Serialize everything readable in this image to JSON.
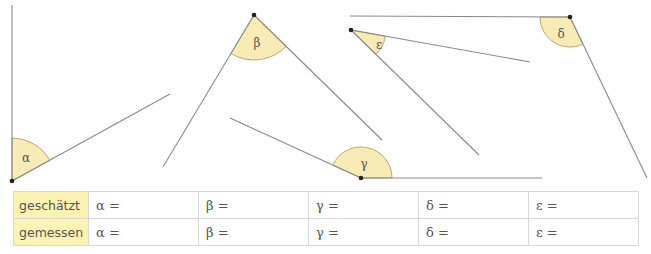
{
  "figure": {
    "angles": [
      {
        "name": "alpha",
        "symbol": "α"
      },
      {
        "name": "beta",
        "symbol": "β"
      },
      {
        "name": "gamma",
        "symbol": "γ"
      },
      {
        "name": "delta",
        "symbol": "δ"
      },
      {
        "name": "epsilon",
        "symbol": "ε"
      }
    ]
  },
  "table": {
    "rows": [
      {
        "label": "geschätzt",
        "cells": [
          "α =",
          "β =",
          "γ =",
          "δ =",
          "ε ="
        ]
      },
      {
        "label": "gemessen",
        "cells": [
          "α =",
          "β =",
          "γ =",
          "δ =",
          "ε ="
        ]
      }
    ]
  },
  "colors": {
    "sector_fill": "#f8ecb6",
    "row_header_fill": "#fbf3b2",
    "line": "#8a8a8a"
  }
}
